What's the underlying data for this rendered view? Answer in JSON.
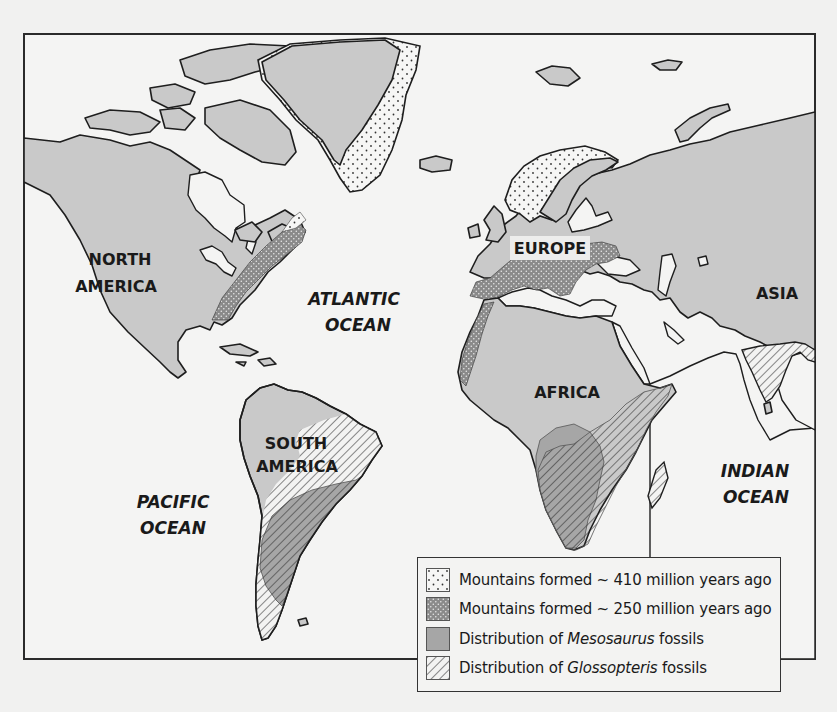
{
  "map": {
    "continent_labels": [
      {
        "id": "north-america",
        "lines": [
          "NORTH",
          "AMERICA"
        ]
      },
      {
        "id": "south-america",
        "lines": [
          "SOUTH",
          "AMERICA"
        ]
      },
      {
        "id": "europe",
        "lines": [
          "EUROPE"
        ]
      },
      {
        "id": "africa",
        "lines": [
          "AFRICA"
        ]
      },
      {
        "id": "asia",
        "lines": [
          "ASIA"
        ]
      }
    ],
    "ocean_labels": [
      {
        "id": "atlantic",
        "lines": [
          "ATLANTIC",
          "OCEAN"
        ]
      },
      {
        "id": "pacific",
        "lines": [
          "PACIFIC",
          "OCEAN"
        ]
      },
      {
        "id": "indian",
        "lines": [
          "INDIAN",
          "OCEAN"
        ]
      }
    ],
    "colors": {
      "background": "#f1f1f0",
      "land": "#c9c9c9",
      "mountains_250": "#8e8e8e",
      "mesosaurus": "#a9a9a9",
      "outline": "#1e1e1e"
    }
  },
  "legend": {
    "items": [
      {
        "pattern": "sparse-dots",
        "prefix": "Mountains formed ~ 410 million years ago",
        "italic": "",
        "suffix": ""
      },
      {
        "pattern": "dense-dots-dark",
        "prefix": "Mountains formed ~ 250 million years ago",
        "italic": "",
        "suffix": ""
      },
      {
        "pattern": "solid-gray",
        "prefix": "Distribution of ",
        "italic": "Mesosaurus",
        "suffix": " fossils"
      },
      {
        "pattern": "diagonal-hatch",
        "prefix": "Distribution of ",
        "italic": "Glossopteris",
        "suffix": " fossils"
      }
    ]
  }
}
